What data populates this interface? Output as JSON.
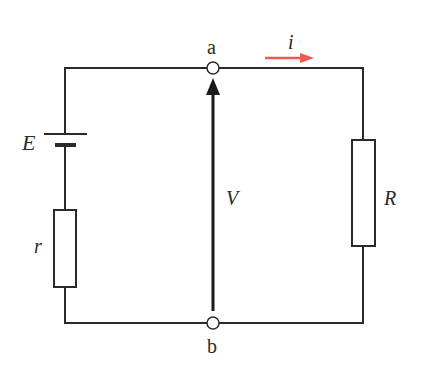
{
  "diagram": {
    "type": "circuit",
    "labels": {
      "emf": "E",
      "internal_resistance": "r",
      "load_resistance": "R",
      "voltage": "V",
      "current": "i",
      "node_top": "a",
      "node_bottom": "b"
    },
    "colors": {
      "wire": "#2a2a2a",
      "current_arrow": "#ee5a4f"
    }
  }
}
